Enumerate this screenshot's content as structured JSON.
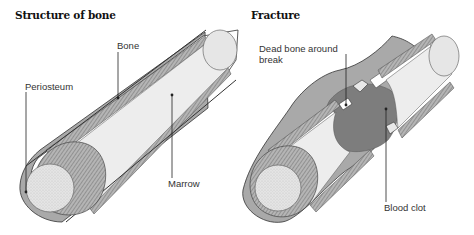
{
  "panels": [
    {
      "title": "Structure of bone",
      "labels": {
        "bone": "Bone",
        "periosteum": "Periosteum",
        "marrow": "Marrow"
      }
    },
    {
      "title": "Fracture",
      "labels": {
        "dead_bone_line1": "Dead bone around",
        "dead_bone_line2": "break",
        "blood_clot": "Blood clot"
      }
    }
  ],
  "colors": {
    "periosteum": "#a9a9a9",
    "bone_cortex": "#8f8f8f",
    "marrow": "#ededed",
    "marrow_end": "#dcdcdc",
    "blood_clot": "#7d7d7d",
    "outline": "#333333"
  }
}
